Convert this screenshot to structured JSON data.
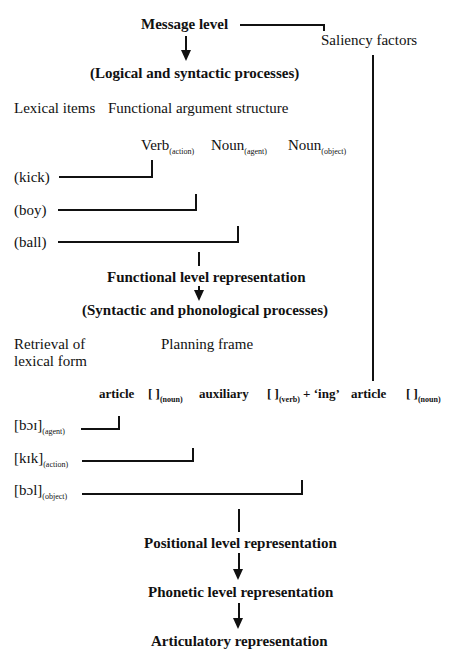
{
  "levels": {
    "message": "Message level",
    "saliency": "Saliency factors",
    "logical": "(Logical and syntactic processes)",
    "functional": "Functional level representation",
    "syntactic_phon": "(Syntactic and phonological processes)",
    "positional": "Positional level representation",
    "phonetic": "Phonetic level representation",
    "articulatory": "Articulatory representation"
  },
  "functional_stage": {
    "lexical_items_label": "Lexical items",
    "argument_structure_label": "Functional argument structure",
    "slots": [
      {
        "word": "Verb",
        "role": "(action)"
      },
      {
        "word": "Noun",
        "role": "(agent)"
      },
      {
        "word": "Noun",
        "role": "(object)"
      }
    ],
    "items": [
      "(kick)",
      "(boy)",
      "(ball)"
    ]
  },
  "positional_stage": {
    "retrieval_label_1": "Retrieval of",
    "retrieval_label_2": "lexical form",
    "planning_frame_label": "Planning frame",
    "frame": [
      {
        "text": "article",
        "sub": ""
      },
      {
        "text": "[ ]",
        "sub": "(noun)"
      },
      {
        "text": "auxiliary",
        "sub": ""
      },
      {
        "text": "[ ]",
        "sub": "(verb)",
        "suffix": "+ ‘ing’"
      },
      {
        "text": "article",
        "sub": ""
      },
      {
        "text": "[ ]",
        "sub": "(noun)"
      }
    ],
    "forms": [
      {
        "form": "[bɔɪ]",
        "role": "(agent)"
      },
      {
        "form": "[kɪk]",
        "role": "(action)"
      },
      {
        "form": "[bɔl]",
        "role": "(object)"
      }
    ]
  }
}
